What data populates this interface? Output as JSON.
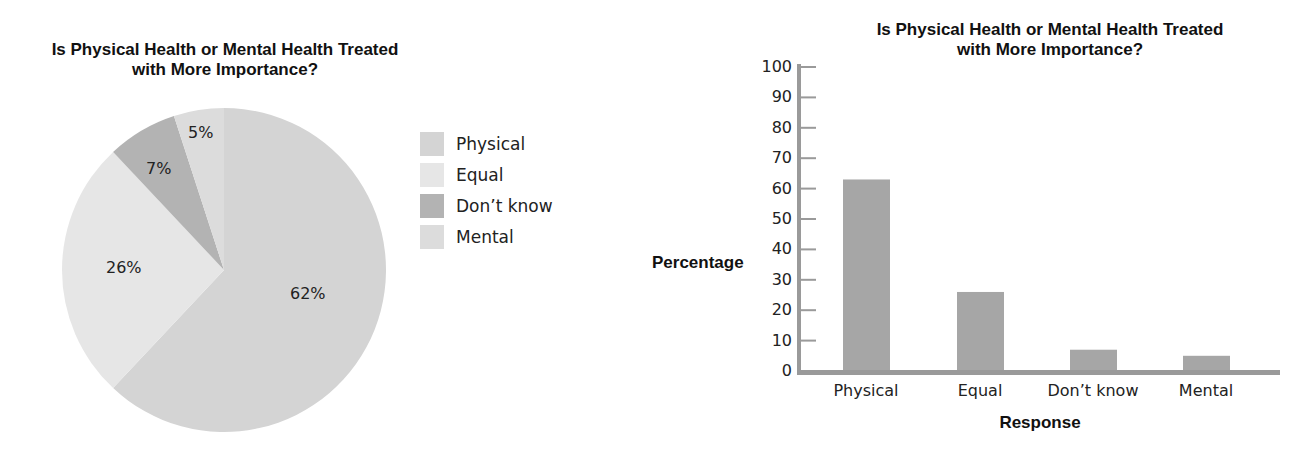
{
  "chart_data": [
    {
      "type": "pie",
      "title": "Is Physical Health or Mental Health Treated with More Importance?",
      "title_lines": [
        "Is Physical Health or Mental Health Treated",
        "with More Importance?"
      ],
      "categories": [
        "Physical",
        "Equal",
        "Don't know",
        "Mental"
      ],
      "values": [
        62,
        26,
        7,
        5
      ],
      "labels": [
        "62%",
        "26%",
        "7%",
        "5%"
      ],
      "colors": [
        "#d4d4d4",
        "#e6e6e6",
        "#b3b3b3",
        "#dcdcdc"
      ],
      "legend": {
        "position": "right",
        "items": [
          {
            "label": "Physical",
            "color": "#d4d4d4"
          },
          {
            "label": "Equal",
            "color": "#e6e6e6"
          },
          {
            "label": "Don’t know",
            "color": "#b3b3b3"
          },
          {
            "label": "Mental",
            "color": "#dcdcdc"
          }
        ]
      }
    },
    {
      "type": "bar",
      "title": "Is Physical Health or Mental Health Treated with More Importance?",
      "title_lines": [
        "Is Physical Health or Mental Health Treated",
        "with More Importance?"
      ],
      "categories": [
        "Physical",
        "Equal",
        "Don’t know",
        "Mental"
      ],
      "values": [
        63,
        26,
        7,
        5
      ],
      "xlabel": "Response",
      "ylabel": "Percentage",
      "ylim": [
        0,
        100
      ],
      "yticks": [
        "0",
        "10",
        "20",
        "30",
        "40",
        "50",
        "60",
        "70",
        "80",
        "90",
        "100"
      ],
      "grid": false,
      "bar_color": "#a6a6a6",
      "axis_color": "#9a9a9a"
    }
  ]
}
